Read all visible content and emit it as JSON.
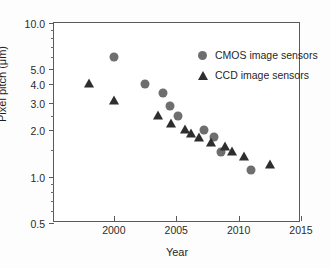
{
  "chart_data": {
    "type": "scatter",
    "title": "",
    "xlabel": "Year",
    "ylabel": "Pixel pitch (μm)",
    "xlim": [
      1995.2,
      2015.0
    ],
    "ylim": [
      0.5,
      10.0
    ],
    "yscale": "log",
    "xscale": "linear",
    "grid": false,
    "legend_position": "top-right inside",
    "xticks": [
      2000,
      2005,
      2010,
      2015
    ],
    "xtick_labels": [
      "2000",
      "2005",
      "2010",
      "2015"
    ],
    "yticks": [
      0.5,
      1.0,
      2.0,
      3.0,
      4.0,
      5.0,
      10.0
    ],
    "ytick_labels": [
      "0.5",
      "1.0",
      "2.0",
      "3.0",
      "4.0",
      "5.0",
      "10.0"
    ],
    "yticks_minor": [
      0.6,
      0.7,
      0.8,
      0.9,
      1.5,
      2.5,
      6.0,
      7.0,
      8.0,
      9.0
    ],
    "series": [
      {
        "name": "CMOS image sensors",
        "marker": "circle",
        "color": "#6e6e6e",
        "points": [
          {
            "x": 2000.0,
            "y": 6.0
          },
          {
            "x": 2002.5,
            "y": 4.0
          },
          {
            "x": 2003.9,
            "y": 3.5
          },
          {
            "x": 2004.5,
            "y": 2.9
          },
          {
            "x": 2005.1,
            "y": 2.5
          },
          {
            "x": 2007.2,
            "y": 2.0
          },
          {
            "x": 2008.0,
            "y": 1.8
          },
          {
            "x": 2008.6,
            "y": 1.45
          },
          {
            "x": 2011.0,
            "y": 1.1
          }
        ]
      },
      {
        "name": "CCD image sensors",
        "marker": "triangle",
        "color": "#2e2e2e",
        "points": [
          {
            "x": 1998.0,
            "y": 4.0
          },
          {
            "x": 2000.0,
            "y": 3.1
          },
          {
            "x": 2003.5,
            "y": 2.5
          },
          {
            "x": 2004.6,
            "y": 2.2
          },
          {
            "x": 2005.7,
            "y": 2.0
          },
          {
            "x": 2006.2,
            "y": 1.9
          },
          {
            "x": 2006.8,
            "y": 1.78
          },
          {
            "x": 2007.8,
            "y": 1.65
          },
          {
            "x": 2008.9,
            "y": 1.55
          },
          {
            "x": 2009.5,
            "y": 1.45
          },
          {
            "x": 2010.4,
            "y": 1.35
          },
          {
            "x": 2012.5,
            "y": 1.2
          }
        ]
      }
    ]
  },
  "legend": {
    "items": [
      {
        "label": "CMOS image sensors",
        "marker": "circle"
      },
      {
        "label": "CCD image sensors",
        "marker": "triangle"
      }
    ]
  }
}
